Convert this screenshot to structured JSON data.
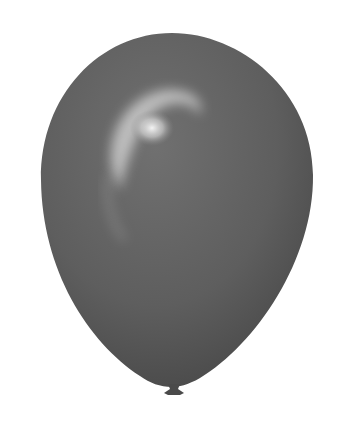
{
  "image": {
    "subject": "balloon",
    "description": "Grey glossy latex balloon with knot on white background",
    "colors": {
      "background": "#ffffff",
      "balloon_base": "#5f5f5f",
      "balloon_dark": "#444444",
      "highlight": "#e8e8e8",
      "knot": "#4a4a4a"
    }
  }
}
